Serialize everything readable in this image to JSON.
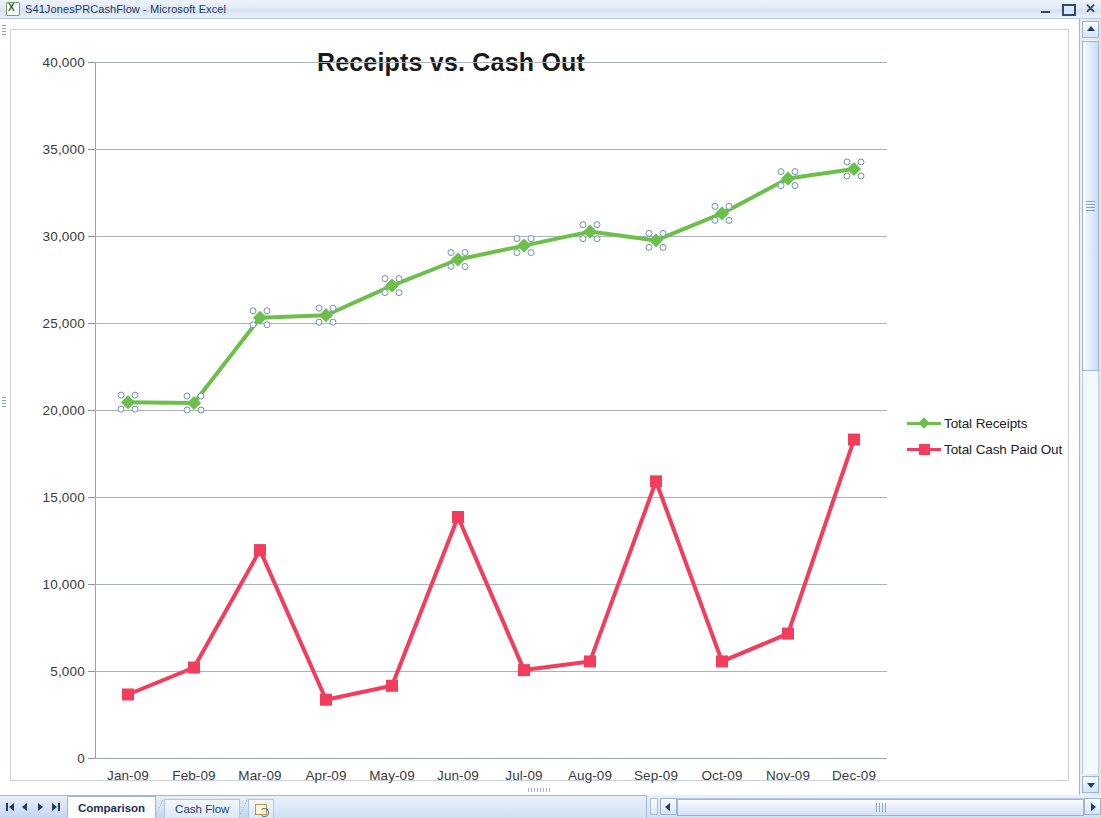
{
  "window": {
    "title": "S41JonesPRCashFlow - Microsoft Excel",
    "app_icon": "excel-icon",
    "minimize_label": "",
    "restore_label": "",
    "close_label": "✕"
  },
  "sheet_tabs": {
    "first_label": "",
    "prev_label": "",
    "next_label": "",
    "last_label": "",
    "tabs": [
      {
        "label": "Comparison",
        "active": true
      },
      {
        "label": "Cash Flow",
        "active": false
      }
    ],
    "new_sheet_label": ""
  },
  "chart_data": {
    "type": "line",
    "title": "Receipts vs. Cash Out",
    "xlabel": "",
    "ylabel": "",
    "ylim": [
      0,
      40000
    ],
    "ytick_step": 5000,
    "yticks": [
      "0",
      "5,000",
      "10,000",
      "15,000",
      "20,000",
      "25,000",
      "30,000",
      "35,000",
      "40,000"
    ],
    "ytick_values": [
      0,
      5000,
      10000,
      15000,
      20000,
      25000,
      30000,
      35000,
      40000
    ],
    "grid": true,
    "legend_position": "right",
    "categories": [
      "Jan-09",
      "Feb-09",
      "Mar-09",
      "Apr-09",
      "May-09",
      "Jun-09",
      "Jul-09",
      "Aug-09",
      "Sep-09",
      "Oct-09",
      "Nov-09",
      "Dec-09"
    ],
    "series": [
      {
        "name": "Total Receipts",
        "color": "#6CC04A",
        "marker": "diamond",
        "selected": true,
        "values": [
          20450,
          20400,
          25300,
          25450,
          27150,
          28650,
          29450,
          30250,
          29750,
          31300,
          33300,
          33850
        ]
      },
      {
        "name": "Total Cash Paid Out",
        "color": "#F23D5C",
        "marker": "square",
        "selected": false,
        "values": [
          3650,
          5200,
          11950,
          3350,
          4150,
          13850,
          5050,
          5550,
          15900,
          5550,
          7150,
          18300
        ]
      }
    ]
  }
}
